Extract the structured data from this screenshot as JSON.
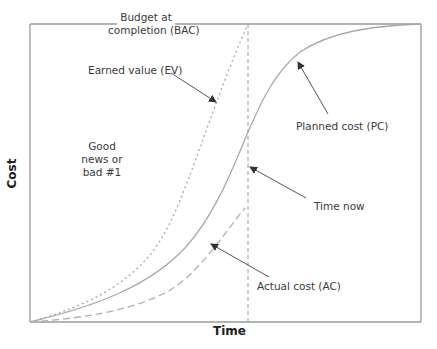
{
  "diagram": {
    "x_axis_label": "Time",
    "y_axis_label": "Cost",
    "labels": {
      "bac_line1": "Budget at",
      "bac_line2": "completion (BAC)",
      "ev": "Earned value  (EV)",
      "pc": "Planned cost (PC)",
      "time_now": "Time now",
      "ac": "Actual cost (AC)",
      "good_news_line1": "Good",
      "good_news_line2": "news or",
      "good_news_line3": "bad #1"
    },
    "colors": {
      "frame": "#9a9a9a",
      "curve": "#a8a8a8",
      "arrow": "#555555",
      "text": "#3a3a3a"
    },
    "curves": [
      {
        "name": "Earned value (EV)",
        "style": "dotted",
        "points": [
          [
            30,
            322
          ],
          [
            100,
            298
          ],
          [
            150,
            255
          ],
          [
            185,
            185
          ],
          [
            215,
            110
          ],
          [
            248,
            24
          ]
        ]
      },
      {
        "name": "Planned cost (PC)",
        "style": "solid",
        "points": [
          [
            30,
            322
          ],
          [
            110,
            300
          ],
          [
            160,
            270
          ],
          [
            200,
            225
          ],
          [
            230,
            165
          ],
          [
            248,
            118
          ],
          [
            268,
            78
          ],
          [
            298,
            53
          ],
          [
            340,
            34
          ],
          [
            421,
            24
          ]
        ]
      },
      {
        "name": "Actual cost (AC)",
        "style": "dashed",
        "points": [
          [
            30,
            322
          ],
          [
            110,
            313
          ],
          [
            160,
            298
          ],
          [
            200,
            265
          ],
          [
            245,
            208
          ]
        ]
      }
    ],
    "time_now_x": 248
  }
}
